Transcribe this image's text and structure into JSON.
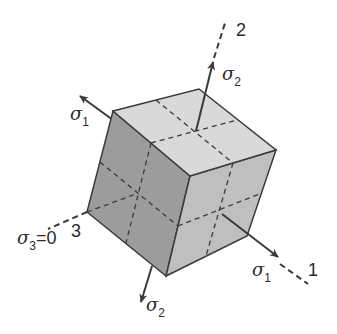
{
  "diagram": {
    "type": "plane-stress-cube",
    "colors": {
      "top_face": "#d9d9d9",
      "left_face": "#9c9c9c",
      "right_face": "#bfbfbf",
      "edge": "#3a3a3a",
      "arrow": "#3a3a3a"
    },
    "axes": {
      "axis1": {
        "label": "1"
      },
      "axis2": {
        "label": "2"
      },
      "axis3": {
        "label": "3"
      }
    },
    "stresses": {
      "sigma1_upper": {
        "symbol": "σ",
        "sub": "1"
      },
      "sigma1_lower": {
        "symbol": "σ",
        "sub": "1"
      },
      "sigma2_upper": {
        "symbol": "σ",
        "sub": "2"
      },
      "sigma2_lower": {
        "symbol": "σ",
        "sub": "2"
      },
      "sigma3": {
        "symbol": "σ",
        "sub": "3",
        "eq": "=0"
      }
    }
  }
}
